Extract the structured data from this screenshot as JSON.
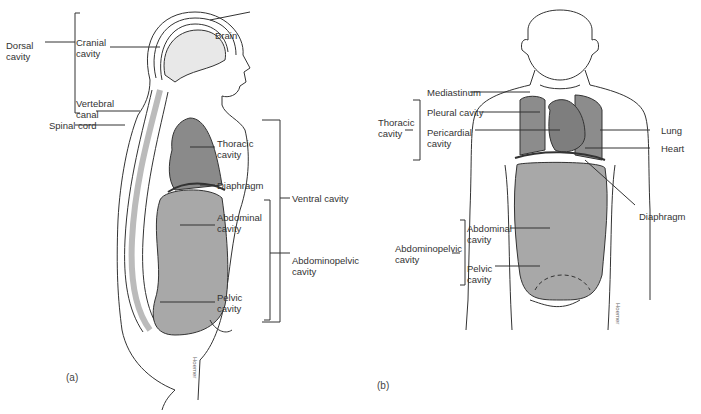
{
  "figure": {
    "panel_a": {
      "label": "(a)",
      "signature": "Hoemer",
      "labels": {
        "dorsal_cavity": "Dorsal\ncavity",
        "cranial_cavity": "Cranial\ncavity",
        "vertebral_canal": "Vertebral\ncanal",
        "spinal_cord": "Spinal cord",
        "brain": "Brain",
        "thoracic_cavity": "Thoracic\ncavity",
        "diaphragm": "Diaphragm",
        "abdominal_cavity": "Abdominal\ncavity",
        "pelvic_cavity": "Pelvic\ncavity",
        "ventral_cavity": "Ventral cavity",
        "abdominopelvic_cavity": "Abdominopelvic\ncavity"
      }
    },
    "panel_b": {
      "label": "(b)",
      "signature": "Hoemer",
      "labels": {
        "thoracic_cavity": "Thoracic\ncavity",
        "mediastinum": "Mediastinum",
        "pleural_cavity": "Pleural cavity",
        "pericardial_cavity": "Pericardial\ncavity",
        "lung": "Lung",
        "heart": "Heart",
        "diaphragm": "Diaphragm",
        "abdominopelvic_cavity": "Abdominopelvic\ncavity",
        "abdominal_cavity": "Abdominal\ncavity",
        "pelvic_cavity": "Pelvic\ncavity"
      }
    },
    "colors": {
      "line": "#333333",
      "thoracic_fill": "#8a8a8a",
      "abdominal_fill": "#a8a8a8",
      "lung_fill": "#8c8c8c",
      "heart_fill": "#7e7e7e"
    }
  }
}
